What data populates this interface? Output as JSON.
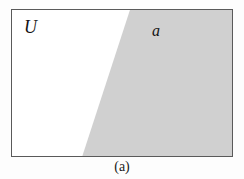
{
  "figure": {
    "caption": "(a)",
    "universe_label": "U",
    "set_label": "a",
    "colors": {
      "page_background": "#fdfdfd",
      "rectangle_fill": "#ffffff",
      "rectangle_border": "#5a5a5a",
      "shaded_region_fill": "#d0d0d0",
      "label_text": "#131313",
      "caption_text": "#1a1a1a"
    },
    "geometry": {
      "canvas_width": 244,
      "canvas_height": 179,
      "rect_left": 11,
      "rect_top": 9,
      "rect_width": 222,
      "rect_height": 148,
      "diagonal_top_x": 119,
      "diagonal_bottom_x": 71,
      "shaded_polygon_points": "119,0 222,0 222,148 71,148"
    }
  }
}
